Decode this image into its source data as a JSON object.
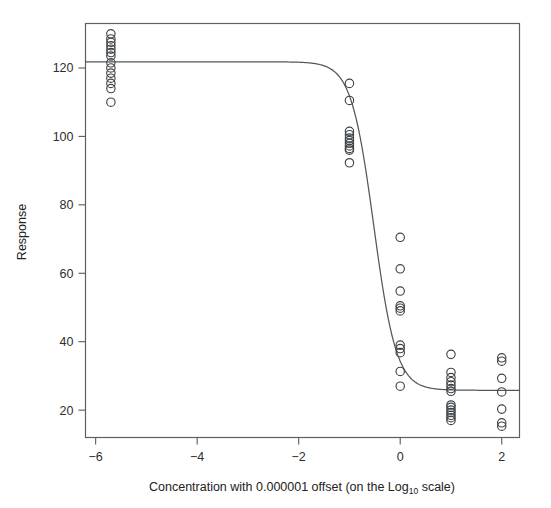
{
  "figure": {
    "width": 551,
    "height": 508,
    "background": "#ffffff"
  },
  "axes": {
    "x_title_part1": "Concentration with 0.000001 offset (on the Log",
    "x_title_sub": "10",
    "x_title_part2": " scale)",
    "x_title_full": "Concentration with 0.000001 offset (on the Log10 scale)",
    "y_title": "Response",
    "x_ticks": [
      "-6",
      "-4",
      "-2",
      "0",
      "2"
    ],
    "y_ticks": [
      "20",
      "40",
      "60",
      "80",
      "100",
      "120"
    ]
  },
  "colors": {
    "point_stroke": "#3f4448",
    "curve_stroke": "#52585c",
    "axis": "#555b5f",
    "text": "#2e2e2e",
    "background": "#ffffff"
  },
  "chart_data": {
    "type": "scatter",
    "title": "",
    "xlabel": "Concentration with 0.000001 offset (on the Log10 scale)",
    "ylabel": "Response",
    "xlim": [
      -6.2,
      2.35
    ],
    "ylim": [
      12,
      133
    ],
    "xticks": [
      -6,
      -4,
      -2,
      0,
      2
    ],
    "yticks": [
      20,
      40,
      60,
      80,
      100,
      120
    ],
    "grid": false,
    "legend": false,
    "marker": "open-circle",
    "series": [
      {
        "name": "Observed response",
        "type": "scatter",
        "x": [
          -5.7,
          -5.7,
          -5.7,
          -5.7,
          -5.7,
          -5.7,
          -5.7,
          -5.7,
          -5.7,
          -5.7,
          -5.7,
          -5.7,
          -5.7,
          -5.7,
          -1,
          -1,
          -1,
          -1,
          -1,
          -1,
          -1,
          -1,
          -1,
          -1,
          -1,
          0,
          0,
          0,
          0,
          0,
          0,
          0,
          0,
          0,
          0,
          0,
          1,
          1,
          1,
          1,
          1,
          1,
          1,
          1,
          1,
          1,
          1,
          1,
          1,
          1,
          2,
          2,
          2,
          2,
          2,
          2,
          2
        ],
        "y": [
          130.0,
          128.5,
          127.5,
          126.5,
          125.5,
          124.5,
          123.5,
          121.5,
          120.0,
          118.5,
          117.0,
          115.5,
          114.0,
          110.0,
          115.5,
          110.5,
          101.5,
          100.5,
          99.5,
          98.8,
          98.0,
          97.2,
          96.5,
          96.0,
          92.3,
          70.5,
          61.3,
          54.8,
          50.5,
          49.8,
          49.0,
          39.0,
          38.0,
          36.8,
          31.3,
          27.0,
          36.3,
          31.0,
          29.5,
          28.3,
          27.3,
          26.3,
          25.5,
          21.5,
          20.8,
          20.0,
          19.3,
          18.5,
          17.8,
          17.0,
          35.3,
          34.3,
          29.3,
          25.3,
          20.3,
          16.3,
          15.3
        ]
      }
    ],
    "fit": {
      "name": "Four-parameter logistic fit",
      "type": "line",
      "model": "y = lower + (upper - lower) / (1 + 10^(slope * (x - ed50)))",
      "upper_asymptote": 121.8,
      "lower_asymptote": 25.8,
      "ed50": -0.52,
      "hill_slope": 1.95
    }
  }
}
